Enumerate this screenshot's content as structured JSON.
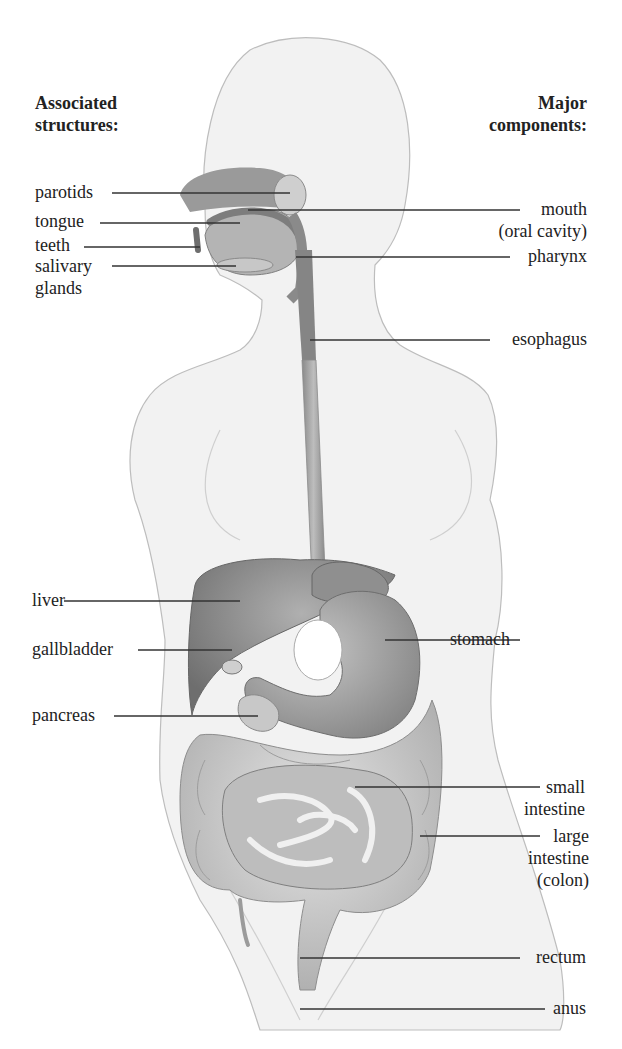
{
  "figure": {
    "headings": {
      "left": [
        "Associated",
        "structures:"
      ],
      "right": [
        "Major",
        "components:"
      ]
    },
    "associated_structures": [
      {
        "label": "parotids"
      },
      {
        "label": "tongue"
      },
      {
        "label": "teeth"
      },
      {
        "label": "salivary",
        "label2": "glands"
      },
      {
        "label": "liver"
      },
      {
        "label": "gallbladder"
      },
      {
        "label": "pancreas"
      }
    ],
    "major_components": [
      {
        "label": "mouth",
        "label2": "(oral cavity)"
      },
      {
        "label": "pharynx"
      },
      {
        "label": "esophagus"
      },
      {
        "label": "stomach"
      },
      {
        "label": "small",
        "label2": "intestine"
      },
      {
        "label": "large",
        "label2": "intestine",
        "label3": "(colon)"
      },
      {
        "label": "rectum"
      },
      {
        "label": "anus"
      }
    ],
    "colors": {
      "body_fill": "#f2f2f2",
      "body_outline": "#bdbdbd",
      "organ_dark": "#7a7a7a",
      "organ_mid": "#a8a8a8",
      "organ_light": "#d4d4d4",
      "leader_line": "#333333"
    }
  }
}
